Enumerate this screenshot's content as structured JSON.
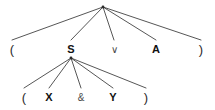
{
  "diagram": {
    "kind": "syntax-tree",
    "background_color": "#ffffff",
    "line_color": "#2b2b2b",
    "text_color": "#1a1a1a",
    "width": 215,
    "height": 110,
    "trees": [
      {
        "id": "upper-tree",
        "name": "outer-disjunction-tree",
        "root": {
          "id": "upper-root",
          "x": 103,
          "y": 7,
          "label": ""
        },
        "children": [
          {
            "id": "upper-leaf-1",
            "label": "(",
            "kind": "paren",
            "x": 12,
            "y": 49
          },
          {
            "id": "upper-leaf-2",
            "label": "S",
            "kind": "nonterm",
            "x": 71,
            "y": 49
          },
          {
            "id": "upper-leaf-3",
            "label": "∨",
            "kind": "op",
            "x": 114,
            "y": 49
          },
          {
            "id": "upper-leaf-4",
            "label": "A",
            "kind": "nonterm",
            "x": 156,
            "y": 49
          },
          {
            "id": "upper-leaf-5",
            "label": ")",
            "kind": "paren",
            "x": 201,
            "y": 49
          }
        ]
      },
      {
        "id": "lower-tree",
        "name": "inner-conjunction-tree",
        "root": {
          "id": "lower-root",
          "x": 71,
          "y": 58,
          "label": ""
        },
        "children": [
          {
            "id": "lower-leaf-1",
            "label": "(",
            "kind": "paren",
            "x": 24,
            "y": 97
          },
          {
            "id": "lower-leaf-2",
            "label": "X",
            "kind": "nonterm",
            "x": 49,
            "y": 97
          },
          {
            "id": "lower-leaf-3",
            "label": "&",
            "kind": "op",
            "x": 81,
            "y": 97
          },
          {
            "id": "lower-leaf-4",
            "label": "Y",
            "kind": "nonterm",
            "x": 113,
            "y": 97
          },
          {
            "id": "lower-leaf-5",
            "label": ")",
            "kind": "paren",
            "x": 146,
            "y": 97
          }
        ]
      }
    ]
  }
}
